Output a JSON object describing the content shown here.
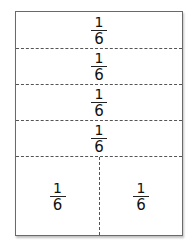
{
  "diagram": {
    "title": "",
    "rows": [
      {
        "label": {
          "numerator": "1",
          "denominator": "6"
        }
      },
      {
        "label": {
          "numerator": "1",
          "denominator": "6"
        }
      },
      {
        "label": {
          "numerator": "1",
          "denominator": "6"
        }
      },
      {
        "label": {
          "numerator": "1",
          "denominator": "6"
        }
      }
    ],
    "bottom_row": [
      {
        "label": {
          "numerator": "1",
          "denominator": "6"
        }
      },
      {
        "label": {
          "numerator": "1",
          "denominator": "6"
        }
      }
    ],
    "colors": {
      "border": "#6a6a6a",
      "dash": "#555555",
      "text": "#111111"
    }
  }
}
